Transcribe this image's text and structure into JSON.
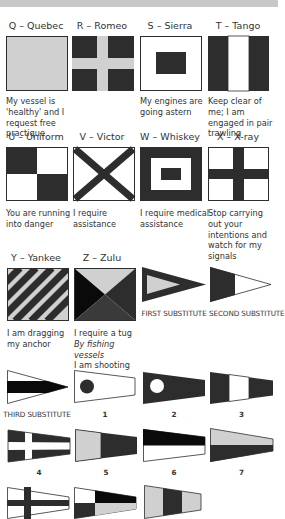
{
  "colors": {
    "dark": "#2d2d2d",
    "light": "#d0d0d0",
    "white": "#ffffff",
    "black": "#0a0a0a",
    "band": "#c8c8c8"
  },
  "flags": [
    {
      "letter": "Q",
      "title": "Q – Quebec",
      "meaning": "My vessel is 'healthy' and I request free practique"
    },
    {
      "letter": "R",
      "title": "R – Romeo",
      "meaning": ""
    },
    {
      "letter": "S",
      "title": "S – Sierra",
      "meaning": "My engines are going astern"
    },
    {
      "letter": "T",
      "title": "T – Tango",
      "meaning": "Keep clear of me; I am engaged in pair trawling"
    },
    {
      "letter": "U",
      "title": "U – Uniform",
      "meaning": "You are running into danger"
    },
    {
      "letter": "V",
      "title": "V – Victor",
      "meaning": "I require assistance"
    },
    {
      "letter": "W",
      "title": "W – Whiskey",
      "meaning": "I require medical assistance"
    },
    {
      "letter": "X",
      "title": "X – X-ray",
      "meaning": "Stop carrying out your intentions and watch for my signals"
    },
    {
      "letter": "Y",
      "title": "Y – Yankee",
      "meaning": "I am dragging my anchor"
    },
    {
      "letter": "Z",
      "title": "Z – Zulu",
      "meaning": "I require a tug",
      "meaning_italic": "By fishing vessels",
      "meaning_extra": "I am shooting nets"
    }
  ],
  "pennants": [
    {
      "id": "first",
      "label": "FIRST SUBSTITUTE"
    },
    {
      "id": "second",
      "label": "SECOND SUBSTITUTE"
    },
    {
      "id": "third",
      "label": "THIRD SUBSTITUTE"
    },
    {
      "id": "1",
      "label": "1"
    },
    {
      "id": "2",
      "label": "2"
    },
    {
      "id": "3",
      "label": "3"
    },
    {
      "id": "4",
      "label": "4"
    },
    {
      "id": "5",
      "label": "5"
    },
    {
      "id": "6",
      "label": "6"
    },
    {
      "id": "7",
      "label": "7"
    },
    {
      "id": "8",
      "label": ""
    },
    {
      "id": "9",
      "label": ""
    },
    {
      "id": "0",
      "label": ""
    }
  ]
}
